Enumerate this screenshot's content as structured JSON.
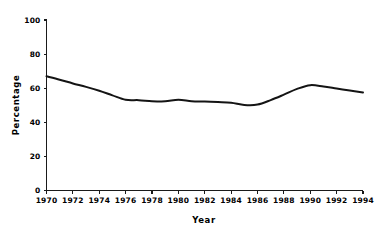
{
  "chart_data": {
    "type": "line",
    "title": "",
    "xlabel": "Year",
    "ylabel": "Percentage",
    "xlim": [
      1970,
      1994
    ],
    "ylim": [
      0,
      100
    ],
    "grid": false,
    "legend": false,
    "line_color": "#141414",
    "background_color": "#ffffff",
    "xticks": [
      1970,
      1972,
      1974,
      1976,
      1978,
      1980,
      1982,
      1984,
      1986,
      1988,
      1990,
      1992,
      1994
    ],
    "xtick_labels": [
      "1970",
      "1972",
      "1974",
      "1976",
      "1978",
      "1980",
      "1982",
      "1984",
      "1986",
      "1988",
      "1990",
      "1992",
      "1994"
    ],
    "yticks": [
      0,
      20,
      40,
      60,
      80,
      100
    ],
    "ytick_labels": [
      "0",
      "20",
      "40",
      "60",
      "80",
      "100"
    ],
    "series": [
      {
        "name": "Percentage",
        "x": [
          1970,
          1971,
          1972,
          1973,
          1974,
          1975,
          1976,
          1977,
          1978,
          1979,
          1980,
          1981,
          1982,
          1983,
          1984,
          1985,
          1986,
          1987,
          1988,
          1989,
          1990,
          1991,
          1992,
          1993,
          1994
        ],
        "values": [
          67.0,
          65.0,
          62.8,
          60.8,
          58.5,
          55.8,
          53.2,
          53.0,
          52.4,
          52.3,
          53.2,
          52.4,
          52.2,
          51.9,
          51.5,
          50.2,
          50.4,
          53.0,
          56.2,
          59.6,
          61.8,
          61.0,
          59.8,
          58.6,
          57.5
        ]
      }
    ]
  },
  "figure": {
    "axis_color": "#1a1a1a"
  }
}
